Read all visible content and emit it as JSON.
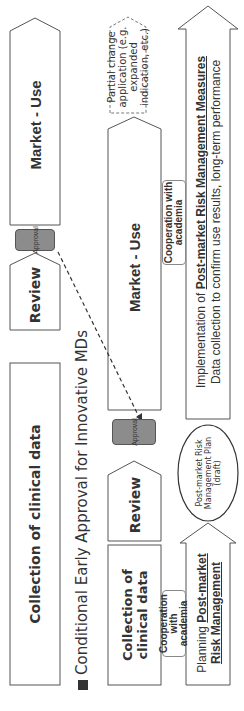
{
  "diagram": {
    "title": "Conditional Early Approval for Innovative MDs",
    "title_bullet": "■",
    "standard_track": {
      "collection": "Collection of clinical data",
      "review": "Review",
      "approval": "Approval",
      "market": "Market - Use"
    },
    "conditional_track": {
      "collection": "Collection of clinical data",
      "review": "Review",
      "approval": "Approval",
      "market": "Market - Use",
      "partial_change": "Partial change application (e.g. expanded indication, etc.)"
    },
    "cooperation_1": "Cooperation with academia",
    "cooperation_2": "Cooperation with academia",
    "planning": {
      "prefix": "Planning ",
      "emph_1": "Post-market",
      "emph_2": "Risk Management"
    },
    "plan_ellipse": "Post-market Risk Management Plan (draft)",
    "implementation": {
      "prefix": "Implementation of ",
      "emph": "Post-market Risk Management Measures",
      "line2": "Data collection to confirm use results, long-term performance"
    },
    "colors": {
      "approval_fill": "#8c8c8c",
      "stroke": "#555555",
      "text": "#333333"
    }
  }
}
